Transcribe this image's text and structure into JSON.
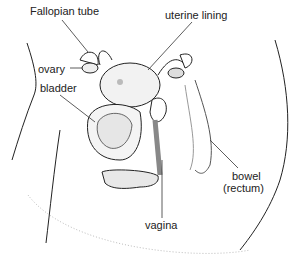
{
  "diagram": {
    "title": "",
    "labels": {
      "fallopian_tube": "Fallopian tube",
      "uterine_lining": "uterine lining",
      "ovary": "ovary",
      "bladder": "bladder",
      "bowel_line1": "bowel",
      "bowel_line2": "(rectum)",
      "vagina": "vagina"
    }
  }
}
